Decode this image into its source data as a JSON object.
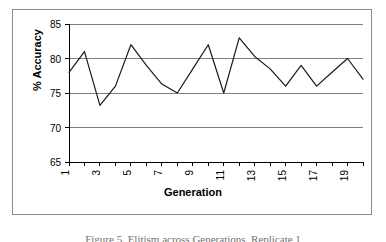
{
  "figure": {
    "caption": "Figure 5. Elitism across Generations, Replicate 1"
  },
  "axes": {
    "y_title": "% Accuracy",
    "x_title": "Generation"
  },
  "colors": {
    "frame": "#8a8a8a",
    "gridline": "#808080",
    "axis": "#000000",
    "series": "#1a1a1a",
    "background": "#ffffff"
  },
  "chart_data": {
    "type": "line",
    "title": "",
    "xlabel": "Generation",
    "ylabel": "% Accuracy",
    "xlim": [
      1,
      20
    ],
    "ylim": [
      65,
      85
    ],
    "ytick_labels": [
      "65",
      "70",
      "75",
      "80",
      "85"
    ],
    "ytick_values": [
      65,
      70,
      75,
      80,
      85
    ],
    "xtick_labels": [
      "1",
      "3",
      "5",
      "7",
      "9",
      "11",
      "13",
      "15",
      "17",
      "19"
    ],
    "xtick_values": [
      1,
      3,
      5,
      7,
      9,
      11,
      13,
      15,
      17,
      19
    ],
    "xtick_rotation": 90,
    "grid": "horizontal",
    "legend": "none",
    "x": [
      1,
      2,
      3,
      4,
      5,
      6,
      7,
      8,
      9,
      10,
      11,
      12,
      13,
      14,
      15,
      16,
      17,
      18,
      19,
      20
    ],
    "values": [
      78,
      81,
      73.2,
      76,
      82,
      79,
      76.3,
      75,
      78.5,
      82,
      75,
      83,
      80.3,
      78.5,
      76,
      79,
      76,
      78,
      80,
      77
    ]
  }
}
